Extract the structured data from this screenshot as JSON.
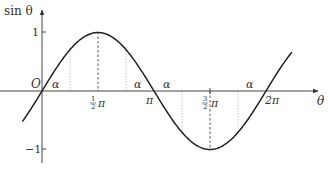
{
  "diagram": {
    "axes": {
      "y_label": "sin θ",
      "x_label": "θ",
      "origin_label": "O",
      "y_ticks": [
        {
          "value": 1,
          "label": "1"
        },
        {
          "value": -1,
          "label": "−1"
        }
      ],
      "x_ticks": [
        {
          "value": "π/2",
          "num": "1",
          "den": "2",
          "sym": "π"
        },
        {
          "value": "π",
          "label": "π"
        },
        {
          "value": "3π/2",
          "num": "3",
          "den": "2",
          "sym": "π"
        },
        {
          "value": "2π",
          "label": "2π"
        }
      ]
    },
    "curve": {
      "function": "sin θ",
      "x_range": "[-0.5, 2π+0.7]",
      "color": "#222222"
    },
    "alpha_marks": [
      {
        "label": "α",
        "position": "0 to α"
      },
      {
        "label": "α",
        "position": "π−α to π"
      },
      {
        "label": "α",
        "position": "π to π+α"
      },
      {
        "label": "α",
        "position": "2π−α to 2π"
      }
    ],
    "colors": {
      "curve": "#222222",
      "axis": "#444444",
      "dotted_guides": "#999999",
      "dashed_guides": "#333333"
    }
  }
}
